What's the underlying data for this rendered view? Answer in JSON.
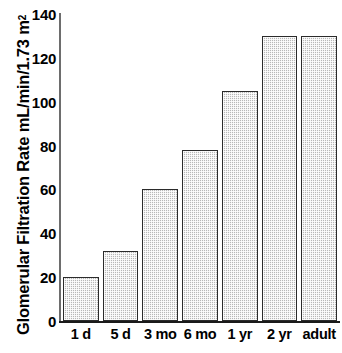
{
  "chart_data": {
    "type": "bar",
    "title": "",
    "xlabel": "",
    "ylabel": "Glomerular Filtration Rate mL/min/1.73 m",
    "ylabel_superscript": "2",
    "categories": [
      "1 d",
      "5 d",
      "3 mo",
      "6 mo",
      "1 yr",
      "2 yr",
      "adult"
    ],
    "values": [
      20,
      32,
      60,
      78,
      105,
      130,
      130
    ],
    "ylim": [
      0,
      140
    ],
    "yticks": [
      0,
      20,
      40,
      60,
      80,
      100,
      120,
      140
    ],
    "ytick_labels": [
      "0",
      "20",
      "40",
      "60",
      "80",
      "100",
      "120",
      "140"
    ],
    "grid": false,
    "legend": null,
    "bar_fill_color": "#b8b8b8",
    "bar_edge_color": "#2b2b2b",
    "axis_color": "#1a1a1a",
    "background_color": "#ffffff"
  },
  "caption_fragment": ""
}
